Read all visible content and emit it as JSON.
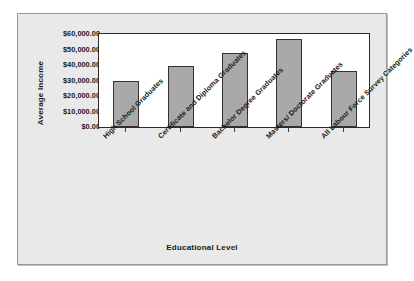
{
  "chart_data": {
    "type": "bar",
    "title": "",
    "xlabel": "Educational Level",
    "ylabel": "Average Income",
    "categories": [
      "High School Graduates",
      "Certificate and Diploma Graduates",
      "Bachelor Degree Graduates",
      "Masters/ Doctorate Graduates",
      "All Labour Force Survey Categories"
    ],
    "values": [
      30000,
      39500,
      47500,
      56500,
      36400
    ],
    "ylim": [
      0,
      60000
    ],
    "ytick_values": [
      0,
      10000,
      20000,
      30000,
      40000,
      50000,
      60000
    ],
    "ytick_labels": [
      "$0.00",
      "$10,000.00",
      "$20,000.00",
      "$30,000.00",
      "$40,000.00",
      "$50,000.00",
      "$60,000.00"
    ],
    "grid": false,
    "legend": false,
    "bar_color": "#a9a9a9",
    "bar_border_color": "#333333",
    "plot_background": "#ffffff",
    "chart_background": "#e9e9e9",
    "axis_color": "#2b2b2b",
    "text_color": "#1a1a1a",
    "label_rotation": -45
  }
}
